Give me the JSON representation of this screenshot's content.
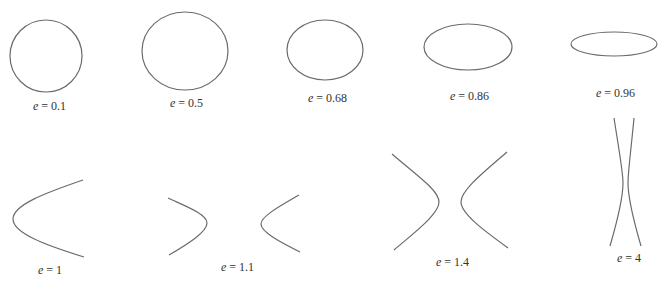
{
  "figure": {
    "stroke_color": "#6b6b6b",
    "panels": [
      {
        "id": "e01",
        "type": "ellipse",
        "variable": "e",
        "value": "0.1",
        "label": "= 0.1",
        "shape": {
          "cx": 46,
          "cy": 56,
          "rx": 36,
          "ry": 36
        },
        "label_pos": {
          "x": 33,
          "y": 99
        }
      },
      {
        "id": "e05",
        "type": "ellipse",
        "variable": "e",
        "value": "0.5",
        "label": "= 0.5",
        "shape": {
          "cx": 185,
          "cy": 51,
          "rx": 43,
          "ry": 39
        },
        "label_pos": {
          "x": 170,
          "y": 96
        }
      },
      {
        "id": "e068",
        "type": "ellipse",
        "variable": "e",
        "value": "0.68",
        "label": "= 0.68",
        "shape": {
          "cx": 325,
          "cy": 50,
          "rx": 38,
          "ry": 30
        },
        "label_pos": {
          "x": 308,
          "y": 91
        }
      },
      {
        "id": "e086",
        "type": "ellipse",
        "variable": "e",
        "value": "0.86",
        "label": "= 0.86",
        "shape": {
          "cx": 468,
          "cy": 47,
          "rx": 44,
          "ry": 23
        },
        "label_pos": {
          "x": 450,
          "y": 89
        }
      },
      {
        "id": "e096",
        "type": "ellipse",
        "variable": "e",
        "value": "0.96",
        "label": "= 0.96",
        "shape": {
          "cx": 614,
          "cy": 44,
          "rx": 43,
          "ry": 12
        },
        "label_pos": {
          "x": 596,
          "y": 86
        }
      },
      {
        "id": "e1",
        "type": "parabola",
        "variable": "e",
        "value": "1",
        "label": "= 1",
        "label_pos": {
          "x": 38,
          "y": 263
        }
      },
      {
        "id": "e11",
        "type": "hyperbola",
        "variable": "e",
        "value": "1.1",
        "label": "= 1.1",
        "label_pos": {
          "x": 221,
          "y": 260
        }
      },
      {
        "id": "e14",
        "type": "hyperbola",
        "variable": "e",
        "value": "1.4",
        "label": "= 1.4",
        "label_pos": {
          "x": 436,
          "y": 255
        }
      },
      {
        "id": "e4",
        "type": "hyperbola",
        "variable": "e",
        "value": "4",
        "label": "= 4",
        "label_pos": {
          "x": 617,
          "y": 251
        }
      }
    ]
  }
}
